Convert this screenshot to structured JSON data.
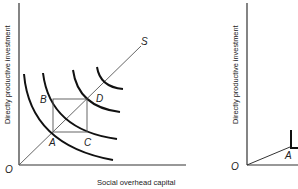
{
  "left_panel": {
    "y_axis_label": "Directly productive investment",
    "x_axis_label": "Social overhead capital",
    "origin_label": "O",
    "ray_label": "S",
    "points": {
      "A": "A",
      "B": "B",
      "C": "C",
      "D": "D"
    }
  },
  "right_panel": {
    "y_axis_label": "Directly productive investment",
    "origin_label": "O",
    "points": {
      "A": "A"
    }
  },
  "colors": {
    "line": "#222222",
    "thin_line": "#555555",
    "background": "#ffffff"
  }
}
